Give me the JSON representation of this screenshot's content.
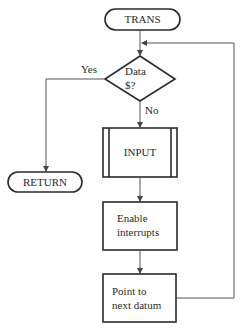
{
  "diagram": {
    "type": "flowchart",
    "nodes": {
      "start": {
        "shape": "terminator",
        "label": "TRANS"
      },
      "decision": {
        "shape": "diamond",
        "label_line1": "Data",
        "label_line2": "$?"
      },
      "return": {
        "shape": "terminator",
        "label": "RETURN"
      },
      "input": {
        "shape": "predefined-process",
        "label": "INPUT"
      },
      "enable": {
        "shape": "process",
        "label_line1": "Enable",
        "label_line2": "interrupts"
      },
      "point": {
        "shape": "process",
        "label_line1": "Point to",
        "label_line2": "next datum"
      }
    },
    "edges": {
      "yes_label": "Yes",
      "no_label": "No"
    },
    "colors": {
      "stroke": "#2a2a2a",
      "connector": "#555555",
      "background": "#ffffff"
    }
  }
}
